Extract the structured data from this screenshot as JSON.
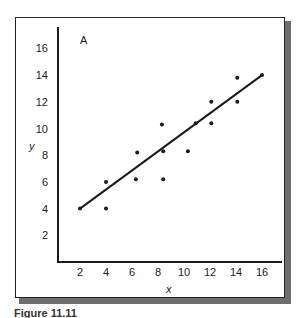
{
  "chart_data": {
    "type": "scatter",
    "title": "",
    "panel_label": "A",
    "xlabel": "x",
    "ylabel": "y",
    "xlim": [
      0,
      17.5
    ],
    "ylim": [
      0,
      17.5
    ],
    "x_ticks": [
      2,
      4,
      6,
      8,
      10,
      12,
      14,
      16
    ],
    "y_ticks": [
      2,
      4,
      6,
      8,
      10,
      12,
      14,
      16
    ],
    "grid": false,
    "legend": null,
    "series": [
      {
        "name": "observations",
        "type": "scatter",
        "points": [
          {
            "x": 2,
            "y": 4
          },
          {
            "x": 4,
            "y": 6
          },
          {
            "x": 4,
            "y": 4
          },
          {
            "x": 6.4,
            "y": 8.2
          },
          {
            "x": 6.3,
            "y": 6.2
          },
          {
            "x": 8.3,
            "y": 10.3
          },
          {
            "x": 8.4,
            "y": 8.3
          },
          {
            "x": 8.4,
            "y": 6.2
          },
          {
            "x": 10.3,
            "y": 8.3
          },
          {
            "x": 10.9,
            "y": 10.4
          },
          {
            "x": 12.1,
            "y": 12
          },
          {
            "x": 12.1,
            "y": 10.4
          },
          {
            "x": 14.1,
            "y": 13.8
          },
          {
            "x": 14.1,
            "y": 12
          },
          {
            "x": 16,
            "y": 14
          }
        ]
      },
      {
        "name": "regression-line",
        "type": "line",
        "points": [
          {
            "x": 2,
            "y": 4
          },
          {
            "x": 16,
            "y": 14
          }
        ]
      }
    ]
  },
  "figure": {
    "panel_label": "A",
    "x_axis_label": "x",
    "y_axis_label": "y",
    "caption": "Figure 11.11"
  },
  "style": {
    "ink": "#1a1a1a",
    "frame_shadow": "#6e6e6e",
    "background": "#ffffff"
  }
}
